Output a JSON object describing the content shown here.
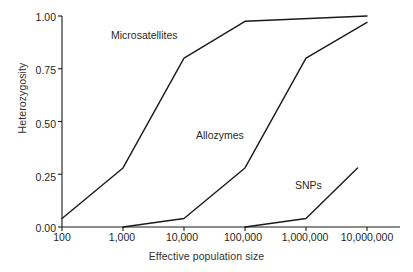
{
  "chart_data": {
    "type": "line",
    "title": "",
    "xlabel": "Effective population size",
    "ylabel": "Heterozygosity",
    "x_scale": "log",
    "xlim": [
      100,
      10000000
    ],
    "ylim": [
      0.0,
      1.0
    ],
    "grid": false,
    "legend_position": "inline-annotations",
    "x_ticks": [
      {
        "value": 100,
        "label": "100"
      },
      {
        "value": 1000,
        "label": "1,000"
      },
      {
        "value": 10000,
        "label": "10,000"
      },
      {
        "value": 100000,
        "label": "100,000"
      },
      {
        "value": 1000000,
        "label": "1,000,000"
      },
      {
        "value": 10000000,
        "label": "10,000,000"
      }
    ],
    "y_ticks": [
      {
        "value": 0.0,
        "label": "0.00"
      },
      {
        "value": 0.25,
        "label": "0.25"
      },
      {
        "value": 0.5,
        "label": "0.50"
      },
      {
        "value": 0.75,
        "label": "0.75"
      },
      {
        "value": 1.0,
        "label": "1.00"
      }
    ],
    "series": [
      {
        "name": "Microsatellites",
        "color": "#1a1a1a",
        "points": [
          {
            "x": 100,
            "y": 0.04
          },
          {
            "x": 1000,
            "y": 0.28
          },
          {
            "x": 10000,
            "y": 0.8
          },
          {
            "x": 100000,
            "y": 0.975
          },
          {
            "x": 10000000,
            "y": 1.0
          }
        ]
      },
      {
        "name": "Allozymes",
        "color": "#1a1a1a",
        "points": [
          {
            "x": 1000,
            "y": 0.0
          },
          {
            "x": 10000,
            "y": 0.04
          },
          {
            "x": 100000,
            "y": 0.28
          },
          {
            "x": 1000000,
            "y": 0.8
          },
          {
            "x": 10000000,
            "y": 0.97
          }
        ]
      },
      {
        "name": "SNPs",
        "color": "#1a1a1a",
        "points": [
          {
            "x": 100000,
            "y": 0.0
          },
          {
            "x": 1000000,
            "y": 0.04
          },
          {
            "x": 7000000,
            "y": 0.28
          }
        ]
      }
    ],
    "annotations": [
      {
        "text": "Microsatellites",
        "series": "Microsatellites"
      },
      {
        "text": "Allozymes",
        "series": "Allozymes"
      },
      {
        "text": "SNPs",
        "series": "SNPs"
      }
    ]
  }
}
